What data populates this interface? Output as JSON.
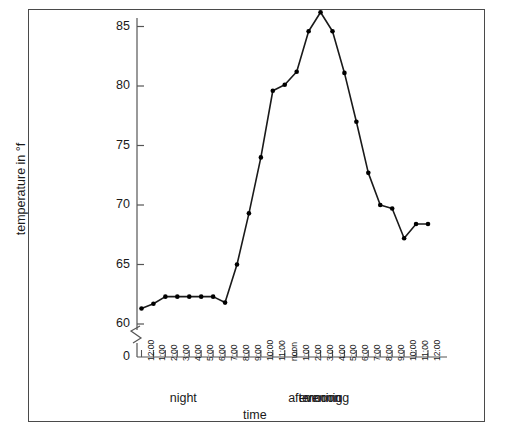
{
  "figure": {
    "background_color": "#ffffff",
    "frame_color": "#4a4a4a",
    "line_color": "#1a1a1a",
    "marker_color": "#000000"
  },
  "chart_data": {
    "type": "line",
    "title": "",
    "xlabel": "time",
    "ylabel": "temperature in °f",
    "ylim": [
      59,
      87
    ],
    "ytick_labels": [
      "0",
      "60",
      "65",
      "70",
      "75",
      "80",
      "85"
    ],
    "ytick_values": [
      0,
      60,
      65,
      70,
      75,
      80,
      85
    ],
    "axis_break": true,
    "axis_break_note": "zigzag break between 0 and 60 on the y-axis",
    "grid": false,
    "legend": "none",
    "marker": "filled-circle",
    "categories": [
      "12:00",
      "1:00",
      "2:00",
      "3:00",
      "4:00",
      "5:00",
      "6:00",
      "7:00",
      "8:00",
      "9:00",
      "10:00",
      "11:00",
      "noon",
      "1:00",
      "2:00",
      "3:00",
      "4:00",
      "5:00",
      "6:00",
      "7:00",
      "8:00",
      "9:00",
      "10:00",
      "11:00",
      "12:00"
    ],
    "values": [
      61.3,
      61.7,
      62.3,
      62.3,
      62.3,
      62.3,
      62.3,
      61.8,
      65.0,
      69.3,
      74.0,
      79.6,
      80.1,
      81.2,
      84.6,
      86.2,
      84.6,
      81.1,
      77.0,
      72.7,
      70.0,
      69.7,
      67.2,
      68.4,
      68.4
    ],
    "period_labels": [
      "night",
      "morning",
      "afternoon",
      "evening"
    ],
    "period_spans": [
      {
        "label": "night",
        "start": "12:00",
        "end": "7:00"
      },
      {
        "label": "morning",
        "start": "8:00",
        "end": "11:00"
      },
      {
        "label": "afternoon",
        "start": "noon",
        "end": "5:00"
      },
      {
        "label": "evening",
        "start": "6:00",
        "end": "12:00"
      }
    ]
  }
}
